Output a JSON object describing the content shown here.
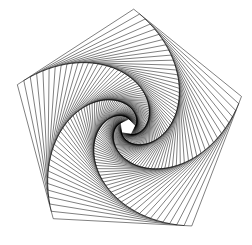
{
  "canvas": {
    "width": 252,
    "height": 245,
    "background_color": "#ffffff"
  },
  "figure": {
    "name": "whirling-pentagon-spiral",
    "stroke_color": "#000000",
    "stroke_width": 0.5,
    "fill": "none"
  },
  "chart_data": {
    "type": "line",
    "subtitle": "Recursively inscribed pentagons produce five logarithmic spiral arms",
    "xlabel": "",
    "ylabel": "",
    "grid": false,
    "legend": false,
    "xlim": [
      0,
      252
    ],
    "ylim": [
      245,
      0
    ],
    "polygon": {
      "sides": 5,
      "center_x": 127.5,
      "center_y": 127.0,
      "outer_circumradius": 118.0,
      "initial_rotation_deg": -87.0,
      "iterations": 72,
      "edge_fraction": 0.0555,
      "scale_per_step": 0.9537,
      "rotation_per_step_deg": 3.37,
      "spiral_direction": "clockwise-inward",
      "arms": 5
    },
    "outer_vertices": [
      [
        124,
        12
      ],
      [
        243,
        97
      ],
      [
        203,
        231
      ],
      [
        55,
        231
      ],
      [
        12,
        96
      ]
    ],
    "inner_white_core": {
      "center_x": 127,
      "center_y": 128,
      "approx_radius": 7,
      "color": "#ffffff"
    }
  }
}
